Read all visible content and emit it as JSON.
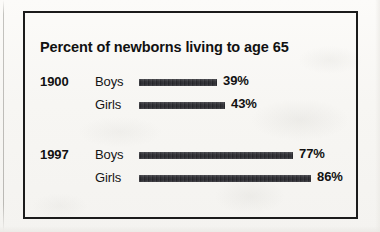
{
  "figure": {
    "title": "Percent of newborns living to age 65",
    "frame_color": "#1b1b1b",
    "bar_color": "#2c2c31",
    "background_color": "#f7f6f3"
  },
  "groups": [
    {
      "year": "1900",
      "rows": [
        {
          "label": "Boys",
          "value_label": "39%"
        },
        {
          "label": "Girls",
          "value_label": "43%"
        }
      ]
    },
    {
      "year": "1997",
      "rows": [
        {
          "label": "Boys",
          "value_label": "77%"
        },
        {
          "label": "Girls",
          "value_label": "86%"
        }
      ]
    }
  ],
  "chart_data": {
    "type": "bar",
    "orientation": "horizontal",
    "title": "Percent of newborns living to age 65",
    "xlabel": "",
    "ylabel": "",
    "xlim": [
      0,
      100
    ],
    "grid": false,
    "legend": false,
    "value_suffix": "%",
    "categories": [
      "1900 Boys",
      "1900 Girls",
      "1997 Boys",
      "1997 Girls"
    ],
    "values": [
      39,
      43,
      77,
      86
    ],
    "groups": [
      {
        "name": "1900",
        "categories": [
          "Boys",
          "Girls"
        ],
        "values": [
          39,
          43
        ]
      },
      {
        "name": "1997",
        "categories": [
          "Boys",
          "Girls"
        ],
        "values": [
          77,
          86
        ]
      }
    ],
    "data_labels": [
      "39%",
      "43%",
      "77%",
      "86%"
    ],
    "px_per_unit": 2.0,
    "bar_origin_x_px": 139
  }
}
